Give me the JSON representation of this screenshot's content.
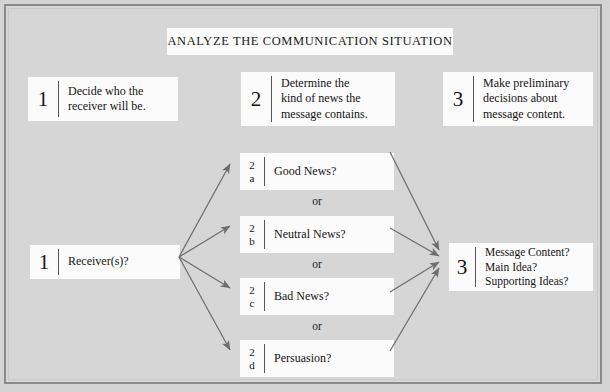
{
  "diagram": {
    "title": "ANALYZE THE COMMUNICATION SITUATION",
    "background_color": "#d4d4d4",
    "box_color": "#fbfbfb",
    "frame_border_color": "#8a8a8a",
    "arrow_color": "#6e6e6e",
    "text_color": "#1a1a1a"
  },
  "steps": [
    {
      "number": "1",
      "text": "Decide who the\nreceiver will be."
    },
    {
      "number": "2",
      "text": "Determine the\nkind of news the\nmessage contains."
    },
    {
      "number": "3",
      "text": "Make preliminary\ndecisions about\nmessage content."
    }
  ],
  "flow": {
    "start": {
      "number": "1",
      "label": "Receiver(s)?"
    },
    "branches": [
      {
        "number": "2",
        "letter": "a",
        "label": "Good News?"
      },
      {
        "number": "2",
        "letter": "b",
        "label": "Neutral News?"
      },
      {
        "number": "2",
        "letter": "c",
        "label": "Bad News?"
      },
      {
        "number": "2",
        "letter": "d",
        "label": "Persuasion?"
      }
    ],
    "separators": [
      "or",
      "or",
      "or"
    ],
    "end": {
      "number": "3",
      "lines": [
        "Message Content?",
        "Main Idea?",
        "Supporting Ideas?"
      ]
    }
  }
}
